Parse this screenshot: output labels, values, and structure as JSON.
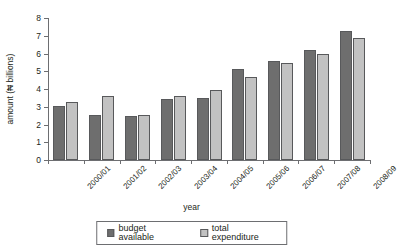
{
  "chart_data": {
    "type": "bar",
    "title": "",
    "subtitle": "",
    "xlabel": "year",
    "ylabel": "amount (₦ billions)",
    "ylim": [
      0,
      8
    ],
    "yticks": [
      0,
      1,
      2,
      3,
      4,
      5,
      6,
      7,
      8
    ],
    "grid": false,
    "legend_position": "bottom",
    "categories": [
      "2000/01",
      "2001/02",
      "2002/03",
      "2003/04",
      "2004/05",
      "2005/06",
      "2006/07",
      "2007/08",
      "2008/09"
    ],
    "series": [
      {
        "name": "budget available",
        "color": "#6e6e6e",
        "values": [
          3.05,
          2.55,
          2.5,
          3.45,
          3.5,
          5.1,
          5.6,
          6.2,
          7.25
        ]
      },
      {
        "name": "total expenditure",
        "color": "#c2c2c2",
        "values": [
          3.25,
          3.6,
          2.55,
          3.6,
          3.95,
          4.7,
          5.45,
          5.95,
          6.9
        ]
      }
    ]
  },
  "axes": {
    "y_title": "amount (₦ billions)",
    "x_title": "year"
  },
  "legend": {
    "items": [
      {
        "label": "budget available",
        "color": "#6e6e6e"
      },
      {
        "label": "total expenditure",
        "color": "#c2c2c2"
      }
    ]
  },
  "colors": {
    "budget": "#6e6e6e",
    "expenditure": "#c2c2c2",
    "axis": "#6d6e71",
    "text": "#231f20",
    "background": "#ffffff"
  }
}
